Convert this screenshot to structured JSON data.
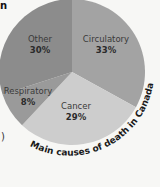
{
  "chart_data": {
    "type": "pie",
    "title": "Main causes of death in Canada",
    "categories": [
      "Circulatory",
      "Cancer",
      "Respiratory",
      "Other"
    ],
    "values": [
      33,
      29,
      8,
      30
    ],
    "unit": "%",
    "colors": [
      "#a3a3a3",
      "#cdcdcd",
      "#9a9a9a",
      "#8c8c8c"
    ],
    "start_angle_deg": 0,
    "direction": "clockwise",
    "labels": [
      {
        "name": "Circulatory",
        "value_label": "33%"
      },
      {
        "name": "Cancer",
        "value_label": "29%"
      },
      {
        "name": "Respiratory",
        "value_label": "8%"
      },
      {
        "name": "Other",
        "value_label": "30%"
      }
    ],
    "legend": "none"
  },
  "fragments": {
    "top_left_char": "n",
    "left_edge_char": ")"
  }
}
